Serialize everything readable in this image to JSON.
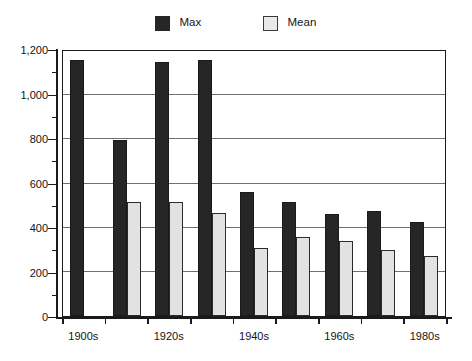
{
  "legend": {
    "position": "top-center",
    "entries": [
      {
        "label": "Max",
        "color": "#262626",
        "swatch": "max-swatch"
      },
      {
        "label": "Mean",
        "color": "#e2e2e2",
        "swatch": "mean-swatch"
      }
    ]
  },
  "axes": {
    "y": {
      "min": 0,
      "max": 1200,
      "major_step": 200,
      "minor_step": 100,
      "tick_labels": [
        "0",
        "200",
        "400",
        "600",
        "800",
        "1,000",
        "1,200"
      ],
      "tick_values": [
        0,
        200,
        400,
        600,
        800,
        1000,
        1200
      ],
      "minor_values": [
        100,
        300,
        500,
        700,
        900,
        1100
      ],
      "label": ""
    },
    "x": {
      "tick_labels": [
        "1900s",
        "1920s",
        "1940s",
        "1960s",
        "1980s"
      ],
      "label": ""
    }
  },
  "chart_data": {
    "type": "bar",
    "title": "",
    "subtitle": "",
    "xlabel": "",
    "ylabel": "",
    "ylim": [
      0,
      1200
    ],
    "grid": true,
    "legend_position": "top-center",
    "categories": [
      "1900s",
      "1910s",
      "1920s",
      "1930s",
      "1940s",
      "1950s",
      "1960s",
      "1970s",
      "1980s"
    ],
    "visible_tick_labels": [
      "1900s",
      "1920s",
      "1940s",
      "1960s",
      "1980s"
    ],
    "series": [
      {
        "name": "Max",
        "color": "#262626",
        "values": [
          1160,
          795,
          1150,
          1160,
          560,
          515,
          460,
          475,
          425
        ]
      },
      {
        "name": "Mean",
        "color": "#e2e2e2",
        "values": [
          null,
          515,
          515,
          465,
          310,
          360,
          340,
          300,
          270
        ]
      }
    ]
  },
  "colors": {
    "max_bar": "#262626",
    "mean_bar": "#e2e2e2",
    "gridline": "#6f6f6f",
    "axis": "#1a1a1a",
    "background": "#ffffff",
    "text": "#141414"
  }
}
